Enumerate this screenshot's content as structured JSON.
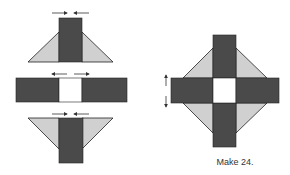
{
  "caption": "Make 24.",
  "colors": {
    "dark": "#4a4a4a",
    "light": "#d0d0d0",
    "white": "#ffffff",
    "outline": "#222222",
    "arrow": "#444444"
  },
  "units": [
    {
      "name": "top-unit",
      "description": "dark rectangle with light triangles, seams pressed toward center"
    },
    {
      "name": "middle-strip",
      "description": "dark-white-dark strip, seams pressed outward"
    },
    {
      "name": "bottom-unit",
      "description": "dark rectangle with light triangles, seams pressed toward center"
    }
  ],
  "finished_block": {
    "description": "assembled block with vertical seam arrows"
  }
}
